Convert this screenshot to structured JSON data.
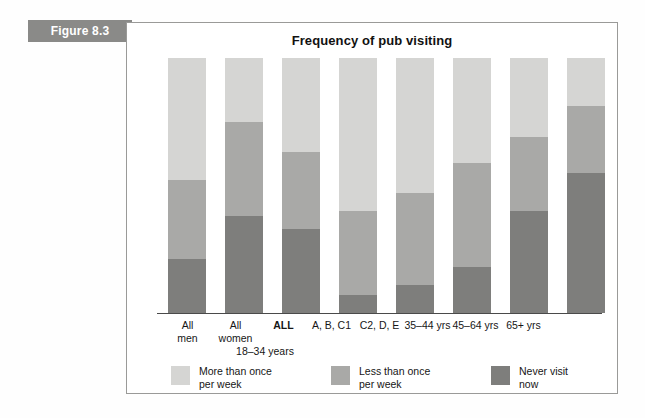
{
  "figure": {
    "tab_label": "Figure 8.3",
    "title": "Frequency of pub visiting"
  },
  "colors": {
    "more_than_once": "#d5d5d3",
    "less_than_once": "#a9a9a7",
    "never_visit": "#7e7e7c",
    "tab_background": "#8a8a88",
    "panel_border": "#9a9a98",
    "axis": "#4a4a4a"
  },
  "axis": {
    "group_label": "18–34 years"
  },
  "legend": {
    "items": [
      {
        "label_line1": "More than once",
        "label_line2": "per week",
        "color": "#d5d5d3",
        "key": "more_than_once"
      },
      {
        "label_line1": "Less than once",
        "label_line2": "per week",
        "color": "#a9a9a7",
        "key": "less_than_once"
      },
      {
        "label_line1": "Never visit",
        "label_line2": "now",
        "color": "#7e7e7c",
        "key": "never_visit"
      }
    ]
  },
  "chart_data": {
    "type": "bar",
    "stacked": true,
    "title": "Frequency of pub visiting",
    "xlabel": "",
    "ylabel": "",
    "ylim": [
      0,
      100
    ],
    "grid": false,
    "legend_position": "bottom",
    "categories": [
      {
        "line1": "All",
        "line2": "men",
        "bold": false
      },
      {
        "line1": "All",
        "line2": "women",
        "bold": false
      },
      {
        "line1": "ALL",
        "line2": "",
        "bold": true
      },
      {
        "line1": "A, B, C1",
        "line2": "",
        "bold": false
      },
      {
        "line1": "C2, D, E",
        "line2": "",
        "bold": false
      },
      {
        "line1": "35–44 yrs",
        "line2": "",
        "bold": false
      },
      {
        "line1": "45–64 yrs",
        "line2": "",
        "bold": false
      },
      {
        "line1": "65+ yrs",
        "line2": "",
        "bold": false
      }
    ],
    "category_group_note": "18–34 years",
    "series": [
      {
        "name": "More than once per week",
        "color": "#d5d5d3",
        "values": [
          48,
          25,
          37,
          60,
          53,
          41,
          31,
          19
        ]
      },
      {
        "name": "Less than once per week",
        "color": "#a9a9a7",
        "values": [
          31,
          37,
          30,
          33,
          36,
          41,
          29,
          26
        ]
      },
      {
        "name": "Never visit now",
        "color": "#7e7e7c",
        "values": [
          21,
          38,
          33,
          7,
          11,
          18,
          40,
          55
        ]
      }
    ]
  }
}
